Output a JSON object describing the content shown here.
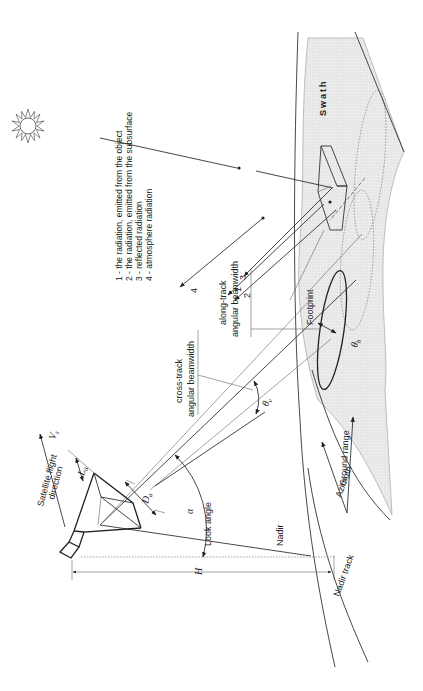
{
  "diagram": {
    "orientation": "rotated 90 degrees counter-clockwise",
    "legend": [
      "1 - the radiation, emitted from the object",
      "2 - the radiation, emitted from the subsurface",
      "3 - reflected radiation",
      "4 - atmosphere radiation"
    ],
    "labels": {
      "swath": "Swath",
      "footprint": "Footprint",
      "cross_track": "cross-track",
      "cross_track_2": "angular beamwidth",
      "along_track": "along-track",
      "along_track_2": "angular beamwidth",
      "satellite_flight": "Satellite flight",
      "satellite_flight_2": "direction",
      "velocity": "V",
      "velocity_sub": "s",
      "look_angle": "Look angle",
      "alpha": "α",
      "nadir": "Nadir",
      "nadir_track": "Nadir track",
      "ground_range": "Ground range",
      "azimuth": "Azimuth",
      "height": "H",
      "antenna_length": "L",
      "antenna_length_sub": "a",
      "antenna_diameter": "D",
      "antenna_diameter_sub": "a",
      "theta_v": "θ",
      "theta_v_sub": "v",
      "theta_h": "θ",
      "theta_h_sub": "h",
      "ray_1": "1",
      "ray_2": "2",
      "ray_3": "3",
      "ray_4": "4"
    },
    "icons": {
      "sun": "sun-icon"
    },
    "colors": {
      "line": "#333333",
      "swath_fill": "#e4e4e4",
      "background": "#ffffff"
    }
  }
}
